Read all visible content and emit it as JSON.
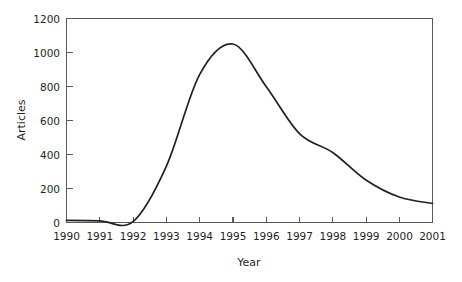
{
  "chart_data": {
    "type": "line",
    "title": "",
    "xlabel": "Year",
    "ylabel": "Articles",
    "xlim": [
      1990,
      2001
    ],
    "ylim": [
      0,
      1200
    ],
    "grid": false,
    "legend": null,
    "x": [
      1990,
      1991,
      1992,
      1993,
      1994,
      1995,
      1996,
      1997,
      1998,
      1999,
      2000,
      2001
    ],
    "categories": [
      "1990",
      "1991",
      "1992",
      "1993",
      "1994",
      "1995",
      "1996",
      "1997",
      "1998",
      "1999",
      "2000",
      "2001"
    ],
    "values": [
      12,
      10,
      5,
      330,
      870,
      1050,
      800,
      523,
      412,
      250,
      150,
      112
    ],
    "series": [
      {
        "name": "Articles",
        "values": [
          12,
          10,
          5,
          330,
          870,
          1050,
          800,
          523,
          412,
          250,
          150,
          112
        ]
      }
    ],
    "annotations": {
      "peak_year": "1995",
      "peak_value": 1060
    },
    "xticks": [
      "1990",
      "1991",
      "1992",
      "1993",
      "1994",
      "1995",
      "1996",
      "1997",
      "1998",
      "1999",
      "2000",
      "2001"
    ],
    "yticks": [
      "0",
      "200",
      "400",
      "600",
      "800",
      "1000",
      "1200"
    ],
    "ytick_values": [
      0,
      200,
      400,
      600,
      800,
      1000,
      1200
    ],
    "line_color": "#231f20",
    "axis_color": "#58595b",
    "background_color": "#ffffff"
  }
}
